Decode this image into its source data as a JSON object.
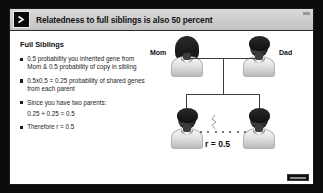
{
  "slide": {
    "title": "Relatedness to full siblings is also 50 percent",
    "chevron_icon": "play-chevron-icon",
    "corner_mark": "slide-corner-marker"
  },
  "content": {
    "heading": "Full Siblings",
    "bullets": [
      {
        "marker": "square-bullet",
        "text": "0.5 probability you inherited gene from Mom & 0.5 probability of copy in sibling"
      },
      {
        "marker": "square-bullet",
        "text": "0.5x0.5 = 0.25 probability of shared genes from each parent"
      },
      {
        "marker": "square-bullet",
        "text": "Since you have two parents:",
        "sub": "0.25 + 0.25 = 0.5"
      },
      {
        "marker": "square-bullet",
        "text": "Therefore r = 0.5"
      }
    ]
  },
  "diagram": {
    "mom_label": "Mom",
    "dad_label": "Dad",
    "relatedness_label": "r = 0.5",
    "figures": {
      "mom": "mother-figure",
      "dad": "father-figure",
      "sibling_left": "sibling-figure-left",
      "sibling_right": "sibling-figure-right"
    },
    "connectors": [
      "mate-line",
      "descent-line",
      "sibship-bar"
    ]
  },
  "colors": {
    "frame": "#0c0c0c",
    "title_bar": "#cfcfcf",
    "text": "#1b1b1b",
    "slide_background": "#ffffff"
  }
}
